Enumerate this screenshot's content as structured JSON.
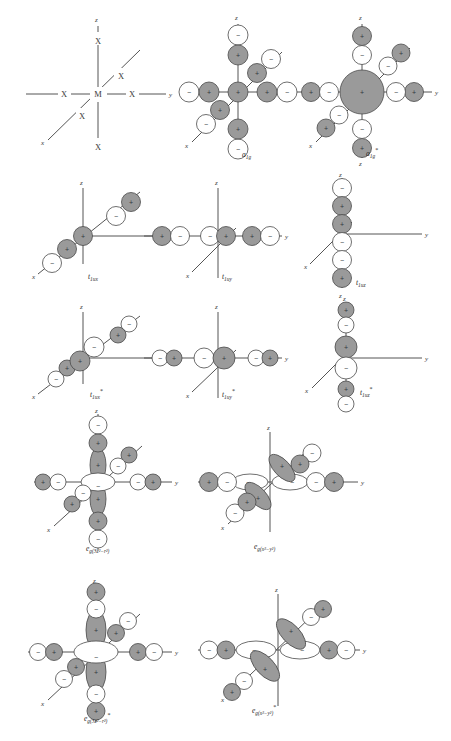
{
  "figure": {
    "type": "molecular-orbital-diagram-set",
    "system": "octahedral MX6 complex",
    "center_atom": "M",
    "ligand_atom": "X",
    "axis_labels": {
      "x": "x",
      "y": "y",
      "z": "z"
    },
    "sign_positive": "+",
    "sign_negative": "−",
    "colors": {
      "lobe_positive": "#9a9a9a",
      "lobe_negative": "#ffffff",
      "stroke": "#4a4a4a",
      "axis": "#555555",
      "text": "#2b2b2b"
    }
  },
  "panels": [
    {
      "id": "skeleton",
      "label": "",
      "label_sub": "",
      "label_star": "",
      "kind": "skeleton",
      "description": "MX6 octahedral skeleton with central M and six X ligands along x, y and z"
    },
    {
      "id": "a1g",
      "label": "a",
      "label_sub": "1g",
      "label_star": "",
      "kind": "ligand-group-orbital",
      "description": "a1g bonding ligand group orbital, all six ligand sigma lobes pointing in-phase toward metal"
    },
    {
      "id": "a1g*",
      "label": "a",
      "label_sub": "1g",
      "label_star": "*",
      "kind": "antibonding",
      "description": "a1g* antibonding combination with large central metal s orbital out of phase with ligands"
    },
    {
      "id": "t1ux",
      "label": "t",
      "label_sub": "1ux",
      "label_star": "",
      "kind": "ligand-group-orbital",
      "description": "t1ux bonding group orbital along the x axis"
    },
    {
      "id": "t1uy",
      "label": "t",
      "label_sub": "1uy",
      "label_star": "",
      "kind": "ligand-group-orbital",
      "description": "t1uy bonding group orbital along the y axis"
    },
    {
      "id": "t1uz",
      "label": "t",
      "label_sub": "1uz",
      "label_star": "",
      "kind": "ligand-group-orbital",
      "description": "t1uz bonding group orbital along the z axis"
    },
    {
      "id": "t1ux*",
      "label": "t",
      "label_sub": "1ux",
      "label_star": "*",
      "kind": "antibonding",
      "description": "t1ux* antibonding combination with metal p(x) orbital"
    },
    {
      "id": "t1uy*",
      "label": "t",
      "label_sub": "1uy",
      "label_star": "*",
      "kind": "antibonding",
      "description": "t1uy* antibonding combination with metal p(y) orbital"
    },
    {
      "id": "t1uz*",
      "label": "t",
      "label_sub": "1uz",
      "label_star": "*",
      "kind": "antibonding",
      "description": "t1uz* antibonding combination with metal p(z) orbital"
    },
    {
      "id": "eg3z2r2",
      "label": "e",
      "label_sub": "g(3z²−r²)",
      "label_star": "",
      "kind": "ligand-group-orbital",
      "description": "eg bonding orbital of 3z²−r² symmetry with metal dz² orbital"
    },
    {
      "id": "egx2y2",
      "label": "e",
      "label_sub": "g(x²−y²)",
      "label_star": "",
      "kind": "ligand-group-orbital",
      "description": "eg bonding orbital of x²−y² symmetry with metal dx²−y² orbital"
    },
    {
      "id": "eg3z2r2*",
      "label": "e",
      "label_sub": "g(3z²−r²)",
      "label_star": "*",
      "kind": "antibonding",
      "description": "eg* antibonding orbital of 3z²−r² symmetry"
    },
    {
      "id": "egx2y2*",
      "label": "e",
      "label_sub": "g(x²−y²)",
      "label_star": "*",
      "kind": "antibonding",
      "description": "eg* antibonding orbital of x²−y² symmetry"
    }
  ],
  "labels": {
    "skeleton_center": "M",
    "skeleton_ligand": "X",
    "a1g": "a1g",
    "a1g_star": "a1g*",
    "t1ux": "t1ux",
    "t1uy": "t1uy",
    "t1uz": "t1uz",
    "t1ux_star": "t1ux*",
    "t1uy_star": "t1uy*",
    "t1uz_star": "t1uz*",
    "eg_3z2_r2": "eg(3z²−r²)",
    "eg_x2_y2": "eg(x²−y²)",
    "eg_3z2_r2_star": "eg(3z²−r²)*",
    "eg_x2_y2_star": "eg(x²−y²)*"
  }
}
